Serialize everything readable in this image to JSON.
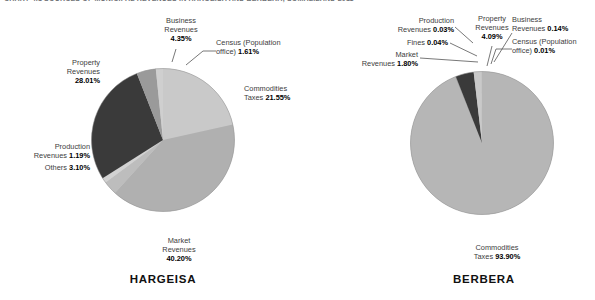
{
  "figure": {
    "title": "CHART 4.1  SOURCES OF MUNICIPAL REVENUES IN HARGEISA AND BERBERA, SOMALILAND 2011"
  },
  "charts": [
    {
      "id": "hargeisa",
      "city_label": "HARGEISA",
      "labels": [
        {
          "name": "property-revenues",
          "line1": "Property",
          "line2": "Revenues",
          "value": "28.01%"
        },
        {
          "name": "business-revenues",
          "line1": "Business",
          "line2": "Revenues",
          "value": "4.35%"
        },
        {
          "name": "census-population",
          "line1": "Census (Population",
          "line2": "office)",
          "value": "1.61%"
        },
        {
          "name": "commodities-taxes",
          "line1": "Commodities",
          "line2": "Taxes",
          "value": "21.55%"
        },
        {
          "name": "market-revenues",
          "line1": "Market",
          "line2": "Revenues",
          "value": "40.20%"
        },
        {
          "name": "production-revenues",
          "line1": "Production",
          "line2": "Revenues",
          "value": "1.19%"
        },
        {
          "name": "others",
          "line1": "",
          "line2": "Others",
          "value": "3.10%"
        }
      ]
    },
    {
      "id": "berbera",
      "city_label": "BERBERA",
      "labels": [
        {
          "name": "production-revenues",
          "line1": "Production",
          "line2": "Revenues",
          "value": "0.03%"
        },
        {
          "name": "fines",
          "line1": "",
          "line2": "Fines",
          "value": "0.04%"
        },
        {
          "name": "market-revenues",
          "line1": "Market",
          "line2": "Revenues",
          "value": "1.80%"
        },
        {
          "name": "property-revenues",
          "line1": "Property",
          "line2": "Revenues",
          "value": "4.09%"
        },
        {
          "name": "business-revenues",
          "line1": "Business",
          "line2": "Revenues",
          "value": "0.14%"
        },
        {
          "name": "census-population",
          "line1": "Census (Population",
          "line2": "office)",
          "value": "0.01%"
        },
        {
          "name": "commodities-taxes",
          "line1": "Commodities",
          "line2": "Taxes",
          "value": "93.90%"
        }
      ]
    }
  ],
  "chart_data": [
    {
      "type": "pie",
      "title": "HARGEISA",
      "categories": [
        "Commodities Taxes",
        "Market Revenues",
        "Others",
        "Production Revenues",
        "Property Revenues",
        "Business Revenues",
        "Census (Population office)"
      ],
      "values": [
        21.55,
        40.2,
        3.1,
        1.19,
        28.01,
        4.35,
        1.61
      ],
      "unit": "percent",
      "colors": [
        "#c9c9c9",
        "#b0b0b0",
        "#bdbdbd",
        "#d2d2d2",
        "#3a3a3a",
        "#9a9a9a",
        "#cfcfcf"
      ],
      "start_angle_deg": 0,
      "direction": "clockwise",
      "legend": "none",
      "data_labels": true
    },
    {
      "type": "pie",
      "title": "BERBERA",
      "categories": [
        "Commodities Taxes",
        "Census (Population office)",
        "Business Revenues",
        "Property Revenues",
        "Market Revenues",
        "Fines",
        "Production Revenues"
      ],
      "values": [
        93.9,
        0.01,
        0.14,
        4.09,
        1.8,
        0.04,
        0.03
      ],
      "unit": "percent",
      "colors": [
        "#b6b6b6",
        "#cfcfcf",
        "#9a9a9a",
        "#3a3a3a",
        "#c9c9c9",
        "#d2d2d2",
        "#bdbdbd"
      ],
      "start_angle_deg": 0,
      "direction": "clockwise",
      "legend": "none",
      "data_labels": true
    }
  ],
  "palette": {
    "dark_slice": "#3a3a3a",
    "mid_slice": "#b0b0b0",
    "light_slice": "#c9c9c9",
    "text": "#3c3c3c",
    "title": "#6f7276"
  }
}
